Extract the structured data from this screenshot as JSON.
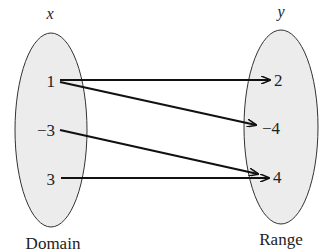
{
  "diagram": {
    "type": "mapping",
    "domain": {
      "header": "x",
      "caption": "Domain",
      "values": [
        "1",
        "−3",
        "3"
      ]
    },
    "range": {
      "header": "y",
      "caption": "Range",
      "values": [
        "2",
        "−4",
        "4"
      ]
    },
    "mappings": [
      {
        "from": "1",
        "to": "2"
      },
      {
        "from": "1",
        "to": "−4"
      },
      {
        "from": "−3",
        "to": "4"
      },
      {
        "from": "3",
        "to": "4"
      }
    ],
    "colors": {
      "ellipse_fill": "#ececec",
      "stroke": "#111111",
      "text": "#222222"
    }
  }
}
